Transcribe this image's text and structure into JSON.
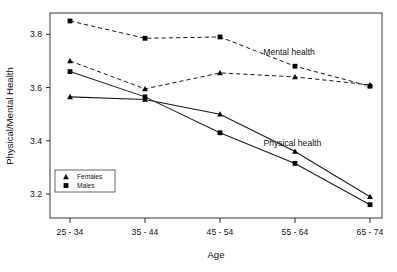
{
  "chart_data": {
    "type": "line",
    "title": "",
    "xlabel": "Age",
    "ylabel": "Physical/Mental Health",
    "categories": [
      "25 - 34",
      "35 - 44",
      "45 - 54",
      "55 - 64",
      "65 - 74"
    ],
    "yticks": [
      3.2,
      3.4,
      3.6,
      3.8
    ],
    "ytick_labels": [
      "3.2",
      "3.4",
      "3.6",
      "3.8"
    ],
    "ylim": [
      3.11,
      3.88
    ],
    "grid": false,
    "legend_position": "inside-lower-left",
    "series": [
      {
        "name": "Mental health - Males",
        "group": "Mental health",
        "sex": "Males",
        "marker": "square",
        "linestyle": "dashed",
        "values": [
          3.85,
          3.785,
          3.79,
          3.68,
          3.605
        ]
      },
      {
        "name": "Mental health - Females",
        "group": "Mental health",
        "sex": "Females",
        "marker": "triangle",
        "linestyle": "dashed",
        "values": [
          3.7,
          3.595,
          3.655,
          3.64,
          3.61
        ]
      },
      {
        "name": "Physical health - Males",
        "group": "Physical health",
        "sex": "Males",
        "marker": "square",
        "linestyle": "solid",
        "values": [
          3.66,
          3.565,
          3.43,
          3.315,
          3.16
        ]
      },
      {
        "name": "Physical health - Females",
        "group": "Physical health",
        "sex": "Females",
        "marker": "triangle",
        "linestyle": "solid",
        "values": [
          3.565,
          3.555,
          3.5,
          3.36,
          3.19
        ]
      }
    ],
    "annotations": [
      {
        "text": "Mental health",
        "x_frac": 0.72,
        "y_value": 3.735
      },
      {
        "text": "Physical health",
        "x_frac": 0.73,
        "y_value": 3.39
      }
    ],
    "legend": {
      "entries": [
        {
          "label": "Females",
          "marker": "triangle"
        },
        {
          "label": "Males",
          "marker": "square"
        }
      ]
    },
    "colors": {
      "line": "#1a1a1a",
      "marker": "#050505",
      "axis": "#3b3b3b",
      "text": "#121212",
      "background": "#ffffff"
    }
  }
}
